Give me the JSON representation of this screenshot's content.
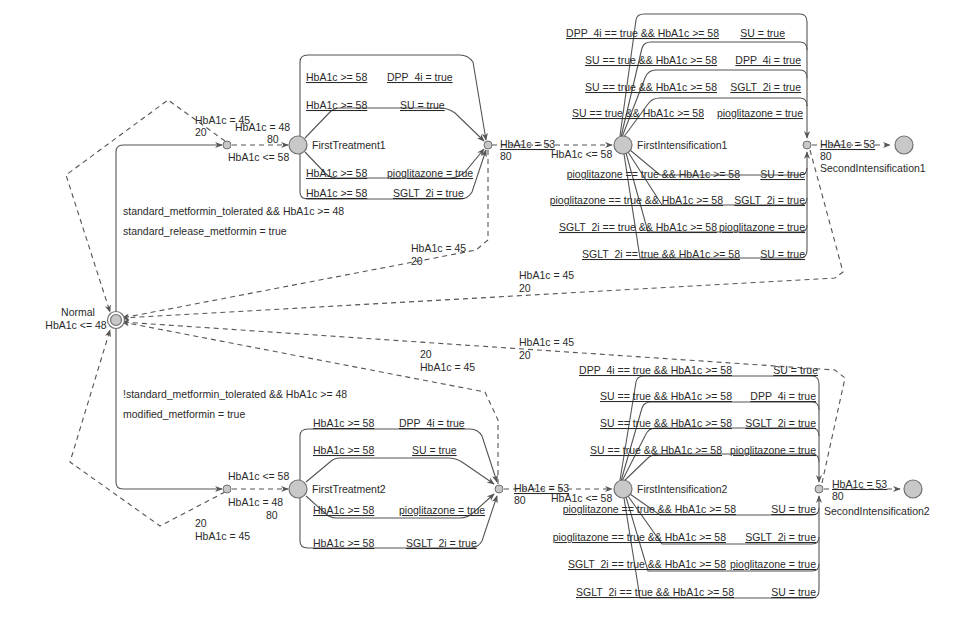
{
  "diagram": {
    "type": "timed-automaton",
    "colors": {
      "node_fill": "#c8c8c8",
      "node_stroke": "#707070",
      "edge": "#555555",
      "text": "#2a2a2a",
      "background": "#ffffff"
    },
    "states": {
      "normal": {
        "name": "Normal",
        "invariant": "HbA1c <= 48"
      },
      "first_treatment_1": {
        "name": "FirstTreatment1"
      },
      "first_treatment_2": {
        "name": "FirstTreatment2"
      },
      "first_intensification_1": {
        "name": "FirstIntensification1"
      },
      "first_intensification_2": {
        "name": "FirstIntensification2"
      },
      "second_intensification_1": {
        "name": "SecondIntensification1"
      },
      "second_intensification_2": {
        "name": "SecondIntensification2"
      }
    },
    "normal_to_ft1": {
      "guard": "standard_metformin_tolerated && HbA1c >= 48",
      "update": "standard_release_metformin = true",
      "branch_success_assign": "HbA1c = 48",
      "branch_success_prob": "80",
      "branch_success_guard": "HbA1c <= 58",
      "branch_fail_assign": "HbA1c = 45",
      "branch_fail_prob": "20"
    },
    "normal_to_ft2": {
      "guard": "!standard_metformin_tolerated && HbA1c >= 48",
      "update": "modified_metformin = true",
      "branch_success_guard": "HbA1c <= 58",
      "branch_success_assign": "HbA1c = 48",
      "branch_success_prob": "80",
      "branch_fail_prob": "20",
      "branch_fail_assign": "HbA1c = 45"
    },
    "ft1_edges": [
      {
        "guard": "HbA1c >= 58",
        "update": "DPP_4i = true"
      },
      {
        "guard": "HbA1c >= 58",
        "update": "SU = true"
      },
      {
        "guard": "HbA1c >= 58",
        "update": "pioglitazone = true"
      },
      {
        "guard": "HbA1c >= 58",
        "update": "SGLT_2i = true"
      }
    ],
    "ft2_edges": [
      {
        "guard": "HbA1c >= 58",
        "update": "DPP_4i = true"
      },
      {
        "guard": "HbA1c >= 58",
        "update": "SU = true"
      },
      {
        "guard": "HbA1c >= 58",
        "update": "pioglitazone = true"
      },
      {
        "guard": "HbA1c >= 58",
        "update": "SGLT_2i = true"
      }
    ],
    "ft1_branch": {
      "assign": "HbA1c = 53",
      "prob": "80",
      "guard": "HbA1c <= 58",
      "fail_assign": "HbA1c = 45",
      "fail_prob": "20"
    },
    "ft2_branch": {
      "assign": "HbA1c = 53",
      "prob": "80",
      "guard": "HbA1c <= 58",
      "fail_prob": "20",
      "fail_assign": "HbA1c = 45"
    },
    "fi1_edges": [
      {
        "guard": "DPP_4i == true && HbA1c >= 58",
        "update": "SU = true"
      },
      {
        "guard": "SU == true && HbA1c >= 58",
        "update": "DPP_4i = true"
      },
      {
        "guard": "SU == true && HbA1c >= 58",
        "update": "SGLT_2i = true"
      },
      {
        "guard": "SU == true && HbA1c >= 58",
        "update": "pioglitazone = true"
      },
      {
        "guard": "pioglitazone == true && HbA1c >= 58",
        "update": "SU = true"
      },
      {
        "guard": "pioglitazone == true && HbA1c >= 58",
        "update": "SGLT_2i = true"
      },
      {
        "guard": "SGLT_2i == true && HbA1c >= 58",
        "update": "pioglitazone = true"
      },
      {
        "guard": "SGLT_2i == true && HbA1c >= 58",
        "update": "SU = true"
      }
    ],
    "fi2_edges": [
      {
        "guard": "DPP_4i == true && HbA1c >= 58",
        "update": "SU = true"
      },
      {
        "guard": "SU == true && HbA1c >= 58",
        "update": "DPP_4i = true"
      },
      {
        "guard": "SU == true && HbA1c >= 58",
        "update": "SGLT_2i = true"
      },
      {
        "guard": "SU == true && HbA1c >= 58",
        "update": "pioglitazone = true"
      },
      {
        "guard": "pioglitazone == true && HbA1c >= 58",
        "update": "SU = true"
      },
      {
        "guard": "pioglitazone == true && HbA1c >= 58",
        "update": "SGLT_2i = true"
      },
      {
        "guard": "SGLT_2i == true && HbA1c >= 58",
        "update": "pioglitazone = true"
      },
      {
        "guard": "SGLT_2i == true && HbA1c >= 58",
        "update": "SU = true"
      }
    ],
    "fi1_branch": {
      "assign": "HbA1c = 53",
      "prob": "80",
      "fail_assign": "HbA1c = 45",
      "fail_prob": "20"
    },
    "fi2_branch": {
      "assign": "HbA1c = 53",
      "prob": "80",
      "fail_assign": "HbA1c = 45",
      "fail_prob": "20"
    }
  }
}
